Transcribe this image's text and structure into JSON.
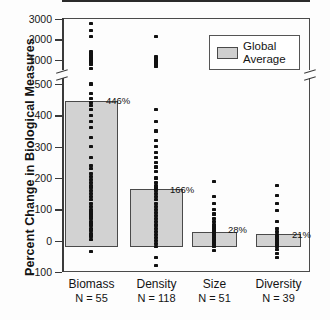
{
  "chart_data": {
    "type": "bar",
    "title": "",
    "xlabel": "",
    "ylabel": "Percent Change in Biological Measures",
    "categories": [
      "Biomass",
      "Density",
      "Size",
      "Diversity"
    ],
    "sample_sizes": [
      "N = 55",
      "N = 118",
      "N = 51",
      "N = 39"
    ],
    "sample_size_values": [
      55,
      118,
      51,
      39
    ],
    "values": [
      446,
      166,
      28,
      21
    ],
    "value_labels": [
      "446%",
      "166%",
      "28%",
      "21%"
    ],
    "series": [
      {
        "name": "Global Average",
        "values": [
          446,
          166,
          28,
          21
        ]
      }
    ],
    "legend": {
      "position": "top-right",
      "entries": [
        "Global Average"
      ]
    },
    "grid": false,
    "axis_break": true,
    "ylim": [
      -100,
      3000
    ],
    "yticks": [
      -100,
      0,
      100,
      200,
      300,
      400,
      500,
      1000,
      2000,
      3000
    ],
    "ytick_labels": [
      "-100",
      "0",
      "100",
      "200",
      "300",
      "400",
      "500",
      "1000",
      "2000",
      "3000"
    ],
    "point_clouds": [
      {
        "category": "Biomass",
        "values": [
          2800,
          2450,
          2150,
          1400,
          1300,
          1200,
          1100,
          1050,
          1000,
          950,
          900,
          850,
          800,
          760,
          560,
          500,
          470,
          455,
          440,
          430,
          420,
          400,
          380,
          360,
          330,
          300,
          265,
          240,
          230,
          215,
          205,
          195,
          185,
          175,
          170,
          160,
          150,
          140,
          130,
          120,
          110,
          100,
          92,
          85,
          78,
          70,
          62,
          55,
          48,
          40,
          32,
          24,
          15,
          5,
          -35
        ]
      },
      {
        "category": "Density",
        "values": [
          2150,
          1150,
          1050,
          980,
          930,
          880,
          840,
          800,
          770,
          650,
          420,
          380,
          350,
          320,
          300,
          280,
          265,
          250,
          235,
          220,
          200,
          185,
          175,
          168,
          166,
          160,
          150,
          140,
          130,
          120,
          110,
          100,
          90,
          80,
          70,
          60,
          50,
          40,
          30,
          20,
          10,
          0,
          -10,
          -20,
          -55,
          -80
        ]
      },
      {
        "category": "Size",
        "values": [
          190,
          140,
          120,
          100,
          85,
          70,
          60,
          52,
          45,
          38,
          32,
          28,
          22,
          16,
          10,
          5,
          0,
          -5,
          -12,
          -20,
          -30
        ]
      },
      {
        "category": "Diversity",
        "values": [
          175,
          145,
          120,
          95,
          60,
          40,
          28,
          21,
          14,
          8,
          2,
          -5,
          -12,
          -20,
          -28,
          -40,
          -55
        ]
      }
    ]
  },
  "legend": {
    "label_line1": "Global",
    "label_line2": "Average"
  }
}
